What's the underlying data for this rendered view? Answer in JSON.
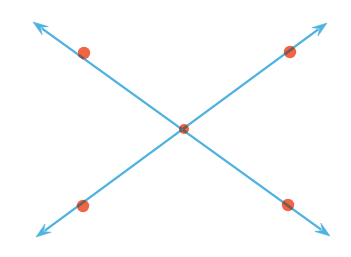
{
  "figure": {
    "title": "Two intersecting lines with marked points",
    "width": 351,
    "height": 257,
    "background_color": "#ffffff",
    "line_color": "#4FB3E0",
    "line_color_dark": "#3AA3D4",
    "point_fill_color": "#EE6644",
    "point_core_color": "#6B2A18",
    "line_width": 2.1,
    "point_radius": 6.2,
    "center_point_radius": 5.0,
    "arrow_length": 15,
    "arrow_half_width": 5.2
  },
  "chart_data": {
    "type": "scatter",
    "title": "Two intersecting lines with marked points",
    "xlabel": "",
    "ylabel": "",
    "xlim": [
      0,
      351
    ],
    "ylim": [
      257,
      0
    ],
    "grid": false,
    "legend": null,
    "axes_visible": false,
    "tick_labels": [],
    "annotations": [],
    "series": [
      {
        "name": "line-nw-se",
        "type": "line",
        "color": "#4FB3E0",
        "arrow_start": true,
        "arrow_end": true,
        "x": [
          33,
          184,
          330
        ],
        "y": [
          22,
          129,
          236
        ],
        "endpoints": [
          {
            "name": "arrow-tip-northwest",
            "x": 33,
            "y": 22
          },
          {
            "name": "arrow-tip-southeast",
            "x": 330,
            "y": 236
          }
        ]
      },
      {
        "name": "line-sw-ne",
        "type": "line",
        "color": "#4FB3E0",
        "arrow_start": true,
        "arrow_end": true,
        "x": [
          36,
          184,
          327
        ],
        "y": [
          237,
          129,
          23
        ],
        "endpoints": [
          {
            "name": "arrow-tip-southwest",
            "x": 36,
            "y": 237
          },
          {
            "name": "arrow-tip-northeast",
            "x": 327,
            "y": 23
          }
        ]
      },
      {
        "name": "marked-points",
        "type": "scatter",
        "color": "#EE6644",
        "x": [
          84,
          290,
          184,
          83,
          288
        ],
        "y": [
          53,
          52,
          129,
          206,
          205
        ],
        "labels": [
          "point-upper-left",
          "point-upper-right",
          "point-intersection",
          "point-lower-left",
          "point-lower-right"
        ]
      }
    ]
  }
}
